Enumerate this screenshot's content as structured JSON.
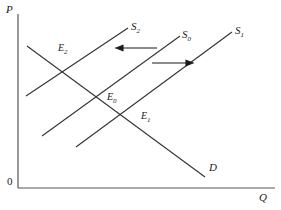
{
  "figure": {
    "type": "line-diagram",
    "background": "#ffffff",
    "stroke_color": "#333333",
    "width": 281,
    "height": 210
  },
  "axes": {
    "y_label": "P",
    "x_label": "Q",
    "origin_label": "0",
    "y_axis": {
      "x": 18,
      "y_top": 14,
      "y_bottom": 188
    },
    "x_axis": {
      "y": 188,
      "x_left": 18,
      "x_right": 275
    }
  },
  "curves": [
    {
      "name": "supply-curve-s2",
      "label": "S",
      "subscript": "2",
      "kind": "supply",
      "from": {
        "x": 26,
        "y": 96
      },
      "to": {
        "x": 128,
        "y": 28
      },
      "label_pos": {
        "x": 131,
        "y": 21
      }
    },
    {
      "name": "supply-curve-s0",
      "label": "S",
      "subscript": "0",
      "kind": "supply",
      "from": {
        "x": 42,
        "y": 136
      },
      "to": {
        "x": 180,
        "y": 36
      },
      "label_pos": {
        "x": 182,
        "y": 29
      }
    },
    {
      "name": "supply-curve-s1",
      "label": "S",
      "subscript": "1",
      "kind": "supply",
      "from": {
        "x": 76,
        "y": 147
      },
      "to": {
        "x": 232,
        "y": 32
      },
      "label_pos": {
        "x": 235,
        "y": 25
      }
    },
    {
      "name": "demand-curve-d",
      "label": "D",
      "subscript": "",
      "kind": "demand",
      "from": {
        "x": 27,
        "y": 46
      },
      "to": {
        "x": 205,
        "y": 177
      },
      "label_pos": {
        "x": 209,
        "y": 162
      }
    }
  ],
  "equilibria": [
    {
      "name": "equilibrium-e2",
      "label": "E",
      "subscript": "2",
      "point": {
        "x": 63,
        "y": 63
      },
      "label_pos": {
        "x": 58,
        "y": 43
      }
    },
    {
      "name": "equilibrium-e0",
      "label": "E",
      "subscript": "0",
      "point": {
        "x": 99,
        "y": 95
      },
      "label_pos": {
        "x": 107,
        "y": 92
      }
    },
    {
      "name": "equilibrium-e1",
      "label": "E",
      "subscript": "1",
      "point": {
        "x": 124,
        "y": 113
      },
      "label_pos": {
        "x": 141,
        "y": 111
      }
    }
  ],
  "arrows": [
    {
      "name": "shift-arrow-left",
      "direction": "left",
      "tail": {
        "x": 157,
        "y": 48
      },
      "head": {
        "x": 116,
        "y": 48
      },
      "meaning": "supply shifts left from S0 to S2"
    },
    {
      "name": "shift-arrow-right",
      "direction": "right",
      "tail": {
        "x": 152,
        "y": 63
      },
      "head": {
        "x": 193,
        "y": 63
      },
      "meaning": "supply shifts right from S0 to S1"
    }
  ],
  "chart_data": {
    "type": "line",
    "title": "",
    "xlabel": "Q",
    "ylabel": "P",
    "grid": false,
    "legend": "inline-curve-labels",
    "series": [
      {
        "name": "S2",
        "points": [
          [
            26,
            96
          ],
          [
            128,
            28
          ]
        ]
      },
      {
        "name": "S0",
        "points": [
          [
            42,
            136
          ],
          [
            180,
            36
          ]
        ]
      },
      {
        "name": "S1",
        "points": [
          [
            76,
            147
          ],
          [
            232,
            32
          ]
        ]
      },
      {
        "name": "D",
        "points": [
          [
            27,
            46
          ],
          [
            205,
            177
          ]
        ]
      }
    ],
    "annotations": [
      "E0",
      "E1",
      "E2",
      "shift-arrow-left",
      "shift-arrow-right"
    ]
  }
}
